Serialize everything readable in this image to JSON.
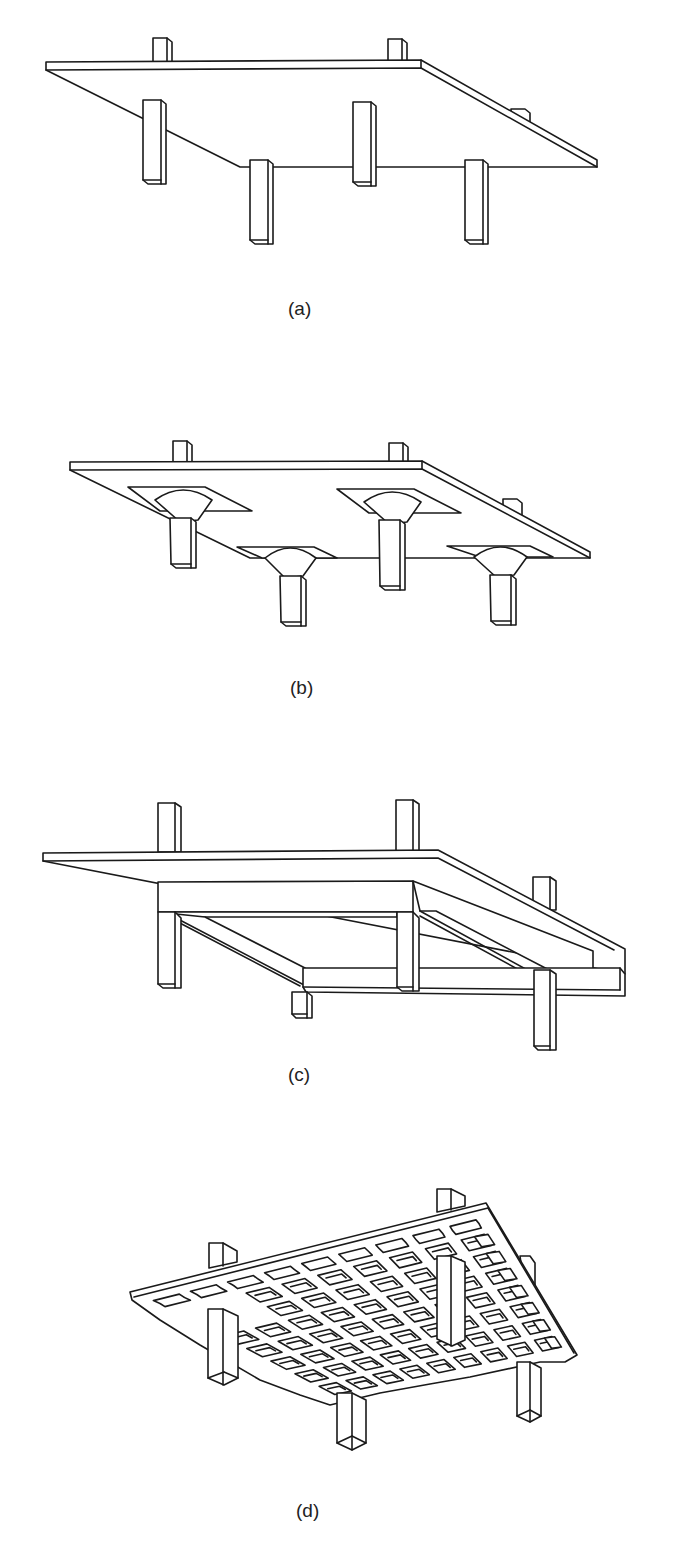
{
  "figure": {
    "panels": [
      {
        "id": "a",
        "label": "(a)",
        "subject": "flat plate slab on columns"
      },
      {
        "id": "b",
        "label": "(b)",
        "subject": "flat slab with drop panels and column capitals"
      },
      {
        "id": "c",
        "label": "(c)",
        "subject": "slab supported on beams between columns"
      },
      {
        "id": "d",
        "label": "(d)",
        "subject": "waffle slab (two-way joist grid) on columns"
      }
    ],
    "caption_cutoff": ""
  },
  "colors": {
    "line": "#1a1a1a",
    "background": "#ffffff"
  }
}
